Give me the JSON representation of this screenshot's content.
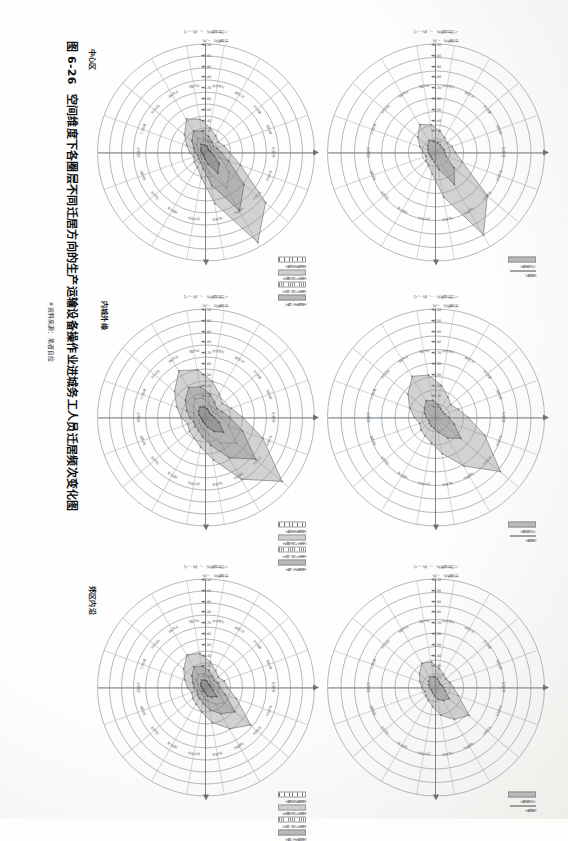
{
  "figure": {
    "number": "图 6-26",
    "title": "空间维度下各圈层不同迁居方向的生产运输设备操作业进城务工人员迁居频次变化图",
    "source": "＊资料来源：笔者自绘"
  },
  "column_headers": [
    {
      "key": "center",
      "label": "中心区"
    },
    {
      "key": "inner_fringe",
      "label": "内城外缘"
    },
    {
      "key": "suburb",
      "label": "郊区内沿"
    }
  ],
  "legend_top": [
    {
      "label": "人口迁移频次",
      "swatch": "fill-a"
    },
    {
      "label": "迁居频次",
      "swatch": "line"
    }
  ],
  "legend_bottom": [
    {
      "label": "迁居频次迁出频次",
      "swatch": "fill-d"
    },
    {
      "label": "迁居务人口迁出频次",
      "swatch": "fill-c"
    },
    {
      "label": "迁居务人口迁入频次",
      "swatch": "fill-b"
    },
    {
      "label": "迁居频次迁入频次",
      "swatch": "fill-a"
    }
  ],
  "axis_titles": [
    "人口迁移频次 /（次/人）",
    "迁居频次 /次"
  ],
  "axis_ticks": [
    "10.00",
    "41.30",
    "41.40",
    "41.50",
    "41.60",
    "41.70",
    "41.80",
    "41.90",
    "42.00",
    "42.10"
  ],
  "category_labels": [
    "住房条件",
    "就业机会",
    "生活成本",
    "交通便利",
    "子女教育",
    "医疗服务",
    "社区环境",
    "社会关系",
    "居住面积",
    "房租水平",
    "工作距离",
    "公共设施",
    "治安状况",
    "邻里关系",
    "购物便利",
    "休闲空间",
    "空气质量",
    "发展前景"
  ],
  "chart_data": [
    {
      "id": "center-top",
      "type": "radar",
      "title": "中心区 上图",
      "rings": 8,
      "legend": [
        "人口迁移频次",
        "迁居频次"
      ],
      "categories": [
        "住房条件",
        "就业机会",
        "生活成本",
        "交通便利",
        "子女教育",
        "医疗服务",
        "社区环境",
        "社会关系",
        "居住面积",
        "房租水平",
        "工作距离",
        "公共设施",
        "治安状况",
        "邻里关系",
        "购物便利",
        "休闲空间",
        "空气质量",
        "发展前景"
      ],
      "series": [
        {
          "name": "人口迁移频次",
          "values": [
            18,
            26,
            62,
            88,
            42,
            20,
            14,
            12,
            10,
            12,
            16,
            22,
            30,
            26,
            20,
            16,
            14,
            16
          ]
        },
        {
          "name": "迁居频次",
          "values": [
            8,
            10,
            22,
            34,
            16,
            9,
            7,
            6,
            6,
            7,
            8,
            10,
            13,
            11,
            9,
            8,
            7,
            8
          ]
        }
      ],
      "rlim": [
        0,
        100
      ]
    },
    {
      "id": "inner-top",
      "type": "radar",
      "title": "内城外缘 上图",
      "rings": 8,
      "legend": [
        "人口迁移频次",
        "迁居频次"
      ],
      "categories": [
        "住房条件",
        "就业机会",
        "生活成本",
        "交通便利",
        "子女教育",
        "医疗服务",
        "社区环境",
        "社会关系",
        "居住面积",
        "房租水平",
        "工作距离",
        "公共设施",
        "治安状况",
        "邻里关系",
        "购物便利",
        "休闲空间",
        "空气质量",
        "发展前景"
      ],
      "series": [
        {
          "name": "人口迁移频次",
          "values": [
            30,
            48,
            78,
            52,
            34,
            24,
            20,
            18,
            16,
            20,
            26,
            34,
            44,
            40,
            30,
            22,
            18,
            22
          ]
        },
        {
          "name": "迁居频次",
          "values": [
            12,
            18,
            30,
            22,
            14,
            10,
            9,
            8,
            7,
            9,
            11,
            14,
            18,
            16,
            12,
            9,
            8,
            9
          ]
        }
      ],
      "rlim": [
        0,
        100
      ]
    },
    {
      "id": "suburb-top",
      "type": "radar",
      "title": "郊区内沿 上图",
      "rings": 8,
      "legend": [
        "人口迁移频次",
        "迁居频次"
      ],
      "categories": [
        "住房条件",
        "就业机会",
        "生活成本",
        "交通便利",
        "子女教育",
        "医疗服务",
        "社区环境",
        "社会关系",
        "居住面积",
        "房租水平",
        "工作距离",
        "公共设施",
        "治安状况",
        "邻里关系",
        "购物便利",
        "休闲空间",
        "空气质量",
        "发展前景"
      ],
      "series": [
        {
          "name": "人口迁移频次",
          "values": [
            16,
            22,
            40,
            34,
            26,
            18,
            14,
            12,
            11,
            13,
            16,
            20,
            26,
            24,
            18,
            14,
            12,
            14
          ]
        },
        {
          "name": "迁居频次",
          "values": [
            7,
            9,
            16,
            14,
            11,
            8,
            6,
            5,
            5,
            6,
            7,
            9,
            11,
            10,
            8,
            6,
            5,
            6
          ]
        }
      ],
      "rlim": [
        0,
        100
      ]
    },
    {
      "id": "center-bottom",
      "type": "radar",
      "title": "中心区 下图",
      "rings": 9,
      "legend": [
        "迁居频次迁出频次",
        "迁居务人口迁出频次",
        "迁居务人口迁入频次",
        "迁居频次迁入频次"
      ],
      "categories": [
        "住房条件",
        "就业机会",
        "生活成本",
        "交通便利",
        "子女教育",
        "医疗服务",
        "社区环境",
        "社会关系",
        "居住面积",
        "房租水平",
        "工作距离",
        "公共设施",
        "治安状况",
        "邻里关系",
        "购物便利",
        "休闲空间",
        "空气质量",
        "发展前景"
      ],
      "series": [
        {
          "name": "迁居频次迁入频次",
          "values": [
            22,
            34,
            72,
            96,
            48,
            24,
            16,
            14,
            12,
            15,
            19,
            26,
            36,
            31,
            23,
            18,
            15,
            18
          ]
        },
        {
          "name": "迁居务人口迁入频次",
          "values": [
            14,
            22,
            46,
            62,
            31,
            15,
            10,
            9,
            8,
            10,
            12,
            17,
            23,
            20,
            15,
            11,
            9,
            11
          ]
        },
        {
          "name": "迁居务人口迁出频次",
          "values": [
            9,
            14,
            28,
            38,
            19,
            10,
            7,
            6,
            5,
            7,
            8,
            11,
            15,
            13,
            10,
            7,
            6,
            7
          ]
        },
        {
          "name": "迁居频次迁出频次",
          "values": [
            5,
            8,
            16,
            22,
            11,
            6,
            4,
            3,
            3,
            4,
            5,
            6,
            9,
            7,
            6,
            4,
            3,
            4
          ]
        }
      ],
      "rlim": [
        0,
        100
      ]
    },
    {
      "id": "inner-bottom",
      "type": "radar",
      "title": "内城外缘 下图",
      "rings": 9,
      "legend": [
        "迁居频次迁出频次",
        "迁居务人口迁出频次",
        "迁居务人口迁入频次",
        "迁居频次迁入频次"
      ],
      "categories": [
        "住房条件",
        "就业机会",
        "生活成本",
        "交通便利",
        "子女教育",
        "医疗服务",
        "社区环境",
        "社会关系",
        "居住面积",
        "房租水平",
        "工作距离",
        "公共设施",
        "治安状况",
        "邻里关系",
        "购物便利",
        "休闲空间",
        "空气质量",
        "发展前景"
      ],
      "series": [
        {
          "name": "迁居频次迁入频次",
          "values": [
            34,
            56,
            92,
            66,
            40,
            28,
            22,
            20,
            18,
            23,
            29,
            38,
            50,
            45,
            34,
            25,
            20,
            25
          ]
        },
        {
          "name": "迁居务人口迁入频次",
          "values": [
            22,
            36,
            60,
            43,
            26,
            18,
            14,
            13,
            12,
            15,
            19,
            25,
            32,
            29,
            22,
            16,
            13,
            16
          ]
        },
        {
          "name": "迁居务人口迁出频次",
          "values": [
            14,
            22,
            37,
            27,
            16,
            11,
            9,
            8,
            7,
            9,
            12,
            15,
            20,
            18,
            14,
            10,
            8,
            10
          ]
        },
        {
          "name": "迁居频次迁出频次",
          "values": [
            8,
            13,
            21,
            15,
            9,
            6,
            5,
            4,
            4,
            5,
            7,
            9,
            11,
            10,
            8,
            6,
            5,
            6
          ]
        }
      ],
      "rlim": [
        0,
        100
      ]
    },
    {
      "id": "suburb-bottom",
      "type": "radar",
      "title": "郊区内沿 下图",
      "rings": 9,
      "legend": [
        "迁居频次迁出频次",
        "迁居务人口迁出频次",
        "迁居务人口迁入频次",
        "迁居频次迁入频次"
      ],
      "categories": [
        "住房条件",
        "就业机会",
        "生活成本",
        "交通便利",
        "子女教育",
        "医疗服务",
        "社区环境",
        "社会关系",
        "居住面积",
        "房租水平",
        "工作距离",
        "公共设施",
        "治安状况",
        "邻里关系",
        "购物便利",
        "休闲空间",
        "空气质量",
        "发展前景"
      ],
      "series": [
        {
          "name": "迁居频次迁入频次",
          "values": [
            20,
            30,
            54,
            44,
            33,
            23,
            18,
            16,
            14,
            17,
            21,
            27,
            35,
            32,
            24,
            18,
            15,
            18
          ]
        },
        {
          "name": "迁居务人口迁入频次",
          "values": [
            13,
            19,
            35,
            28,
            21,
            15,
            12,
            10,
            9,
            11,
            13,
            17,
            22,
            20,
            16,
            12,
            10,
            12
          ]
        },
        {
          "name": "迁居务人口迁出频次",
          "values": [
            8,
            12,
            22,
            18,
            13,
            9,
            7,
            6,
            6,
            7,
            8,
            11,
            14,
            13,
            10,
            7,
            6,
            7
          ]
        },
        {
          "name": "迁居频次迁出频次",
          "values": [
            5,
            7,
            13,
            10,
            8,
            5,
            4,
            4,
            3,
            4,
            5,
            6,
            8,
            7,
            6,
            4,
            4,
            4
          ]
        }
      ],
      "rlim": [
        0,
        100
      ]
    }
  ]
}
